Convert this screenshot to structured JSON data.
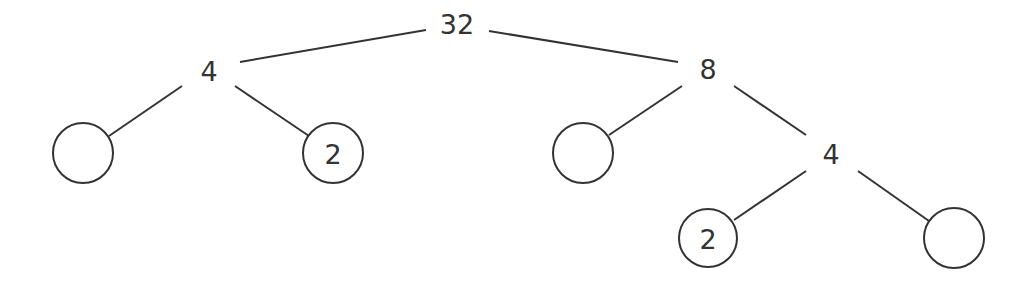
{
  "diagram": {
    "type": "factor-tree",
    "nodes": [
      {
        "id": "root",
        "label": "32",
        "circled": false
      },
      {
        "id": "a",
        "label": "4",
        "circled": false,
        "parent": "root"
      },
      {
        "id": "b",
        "label": "8",
        "circled": false,
        "parent": "root"
      },
      {
        "id": "a1",
        "label": "",
        "circled": true,
        "parent": "a"
      },
      {
        "id": "a2",
        "label": "2",
        "circled": true,
        "parent": "a"
      },
      {
        "id": "b1",
        "label": "",
        "circled": true,
        "parent": "b"
      },
      {
        "id": "b2",
        "label": "4",
        "circled": false,
        "parent": "b"
      },
      {
        "id": "c1",
        "label": "2",
        "circled": true,
        "parent": "b2"
      },
      {
        "id": "c2",
        "label": "",
        "circled": true,
        "parent": "b2"
      }
    ],
    "colors": {
      "stroke": "#333333",
      "background": "#ffffff"
    }
  }
}
